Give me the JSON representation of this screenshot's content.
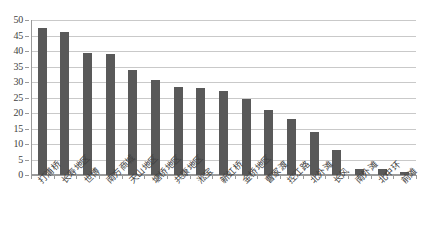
{
  "chart_data": {
    "type": "bar",
    "title": "",
    "subtitle": "",
    "xlabel": "",
    "ylabel": "",
    "ylim": [
      0,
      50
    ],
    "ytick_step": 5,
    "yticks": [
      0,
      5,
      10,
      15,
      20,
      25,
      30,
      35,
      40,
      45,
      50
    ],
    "ytick_labels": [
      "0",
      "5",
      "10",
      "15",
      "20",
      "25",
      "30",
      "35",
      "40",
      "45",
      "50"
    ],
    "grid": "horizontal",
    "legend": "none",
    "bar_color": "#595959",
    "gridline_color": "#c9c9c9",
    "axis_color": "#9a9a9a",
    "background_color": "#ffffff",
    "categories": [
      "打浦桥",
      "长寿地区",
      "世博",
      "南方商城",
      "天山地区",
      "塘桥地区",
      "共康地区",
      "淞宝",
      "新虹桥",
      "金桥地区",
      "曹家渡",
      "控江路",
      "北外滩",
      "长风",
      "南外滩",
      "北中环",
      "前滩"
    ],
    "values": [
      47.5,
      46,
      39.5,
      39,
      34,
      30.5,
      28.5,
      28,
      27,
      24.5,
      21,
      18,
      14,
      8,
      2,
      2,
      1
    ]
  }
}
